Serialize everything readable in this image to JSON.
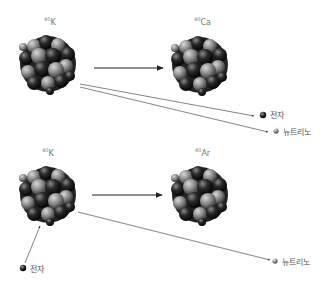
{
  "diagram": {
    "top": {
      "parent": {
        "mass": "40",
        "symbol": "K"
      },
      "daughter": {
        "mass": "40",
        "symbol": "Ca"
      },
      "products": [
        {
          "label": "전자",
          "kind": "electron"
        },
        {
          "label": "뉴트리노",
          "kind": "neutrino"
        }
      ]
    },
    "bottom": {
      "parent": {
        "mass": "40",
        "symbol": "K"
      },
      "daughter": {
        "mass": "40",
        "symbol": "Ar"
      },
      "input": {
        "label": "전자",
        "kind": "electron"
      },
      "products": [
        {
          "label": "뉴트리노",
          "kind": "neutrino"
        }
      ]
    },
    "colors": {
      "arrow": "#333333",
      "nucleon_dark": "#1a1a1a",
      "nucleon_light": "#8a8a8a",
      "electron": "#222222",
      "neutrino": "#888888"
    }
  }
}
